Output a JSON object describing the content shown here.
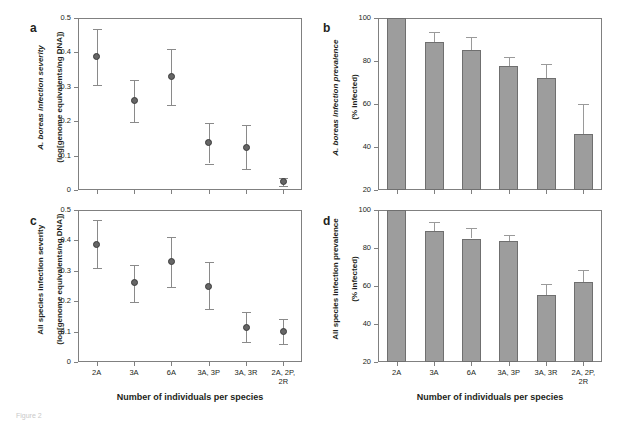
{
  "figure": {
    "caption": "Figure 2",
    "xaxis_title": "Number of individuals per species",
    "categories": [
      "2A",
      "3A",
      "6A",
      "3A, 3P",
      "3A, 3R",
      "2A, 2P,\n2R"
    ],
    "panel_letters": {
      "a": "a",
      "b": "b",
      "c": "c",
      "d": "d"
    },
    "colors": {
      "bar_fill": "#9d9d9d",
      "bar_stroke": "#6f6f6f",
      "point_fill": "#666666",
      "point_stroke": "#3b3b3b",
      "axis": "#808080",
      "text": "#231f20"
    }
  },
  "chart_data": [
    {
      "panel": "a",
      "type": "scatter",
      "title": "",
      "ylabel_line1": "A. boreas infection severity",
      "ylabel_line2": "(log[genome equivalents/ng DNA])",
      "ylabel_italic_part": "A. boreas",
      "xlabel": "Number of individuals per species",
      "categories": [
        "2A",
        "3A",
        "6A",
        "3A, 3P",
        "3A, 3R",
        "2A, 2P, 2R"
      ],
      "values": [
        0.388,
        0.26,
        0.33,
        0.137,
        0.125,
        0.025
      ],
      "err_low": [
        0.082,
        0.062,
        0.082,
        0.06,
        0.063,
        0.012
      ],
      "err_high": [
        0.08,
        0.06,
        0.08,
        0.058,
        0.065,
        0.01
      ],
      "yticks": [
        0,
        0.1,
        0.2,
        0.3,
        0.4,
        0.5
      ],
      "ytick_labels": [
        "0",
        "0.1",
        "0.2",
        "0.3",
        "0.4",
        "0.5"
      ],
      "ylim": [
        0,
        0.5
      ],
      "grid": false,
      "legend": "none"
    },
    {
      "panel": "b",
      "type": "bar",
      "title": "",
      "ylabel_line1": "A. boreas infection prevalence",
      "ylabel_line2": "(% infected)",
      "ylabel_italic_part": "A. boreas",
      "xlabel": "Number of individuals per species",
      "categories": [
        "2A",
        "3A",
        "6A",
        "3A, 3P",
        "3A, 3R",
        "2A, 2P, 2R"
      ],
      "values": [
        100,
        89,
        85,
        77.5,
        72,
        46
      ],
      "err_high": [
        0,
        4.5,
        6,
        4.5,
        6.5,
        14
      ],
      "yticks": [
        20,
        40,
        60,
        80,
        100
      ],
      "ytick_labels": [
        "20",
        "40",
        "60",
        "80",
        "100"
      ],
      "ylim": [
        20,
        100
      ],
      "grid": false,
      "legend": "none"
    },
    {
      "panel": "c",
      "type": "scatter",
      "title": "",
      "ylabel_line1": "All species infection severity",
      "ylabel_line2": "(log[genome equivalents/ng DNA])",
      "ylabel_italic_part": "",
      "xlabel": "Number of individuals per species",
      "categories": [
        "2A",
        "3A",
        "6A",
        "3A, 3P",
        "3A, 3R",
        "2A, 2P, 2R"
      ],
      "values": [
        0.388,
        0.26,
        0.33,
        0.25,
        0.115,
        0.1
      ],
      "err_low": [
        0.08,
        0.062,
        0.082,
        0.077,
        0.05,
        0.04
      ],
      "err_high": [
        0.08,
        0.06,
        0.08,
        0.078,
        0.05,
        0.04
      ],
      "yticks": [
        0,
        0.1,
        0.2,
        0.3,
        0.4,
        0.5
      ],
      "ytick_labels": [
        "0",
        "0.1",
        "0.2",
        "0.3",
        "0.4",
        "0.5"
      ],
      "ylim": [
        0,
        0.5
      ],
      "grid": false,
      "legend": "none"
    },
    {
      "panel": "d",
      "type": "bar",
      "title": "",
      "ylabel_line1": "All species infection prevalence",
      "ylabel_line2": "(% infected)",
      "ylabel_italic_part": "",
      "xlabel": "Number of individuals per species",
      "categories": [
        "2A",
        "3A",
        "6A",
        "3A, 3P",
        "3A, 3R",
        "2A, 2P, 2R"
      ],
      "values": [
        100,
        89,
        85,
        83.5,
        55.5,
        62
      ],
      "err_high": [
        0,
        4.5,
        5.5,
        3.5,
        5.5,
        6.5
      ],
      "yticks": [
        20,
        40,
        60,
        80,
        100
      ],
      "ytick_labels": [
        "20",
        "40",
        "60",
        "80",
        "100"
      ],
      "ylim": [
        20,
        100
      ],
      "grid": false,
      "legend": "none"
    }
  ]
}
